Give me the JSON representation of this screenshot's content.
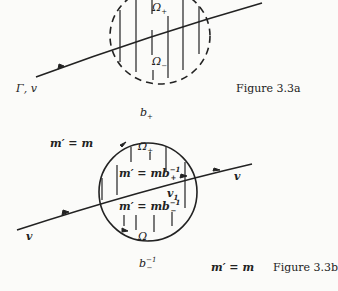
{
  "figure_a": {
    "caption": "Figure 3.3a",
    "curve_label": "Γ, v",
    "region_upper": "Ω",
    "region_upper_sub": "+",
    "region_lower": "Ω",
    "region_lower_sub": "−",
    "below_label": "b",
    "below_label_sub": "+"
  },
  "figure_b": {
    "caption": "Figure 3.3b",
    "top_left_label": "m′ = m",
    "bottom_right_label": "m′ = m",
    "region_upper": "Ω",
    "region_upper_sub": "+",
    "region_lower": "Ω",
    "region_lower_sub": "−",
    "upper_formula": "m′ = mb",
    "upper_formula_sup": "−1",
    "upper_formula_sub": "+",
    "lower_formula": "m′ = mb",
    "lower_formula_sup": "−1",
    "lower_formula_sub": "−",
    "inner_velocity": "v",
    "inner_velocity_sub": "1",
    "left_velocity": "v",
    "right_velocity": "v",
    "below_label": "b",
    "below_label_sup": "−1",
    "below_label_sub": "−"
  }
}
